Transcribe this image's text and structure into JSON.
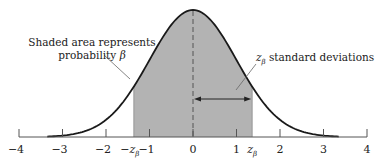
{
  "chart_data": {
    "type": "area",
    "title": "",
    "x_axis": {
      "ticks": [
        -4,
        -3,
        -2,
        -1,
        0,
        1,
        2,
        3,
        4
      ],
      "tick_labels": [
        "−4",
        "−3",
        "−2",
        "−1",
        "0",
        "1",
        "2",
        "3",
        "4"
      ],
      "range": [
        -4,
        4
      ],
      "special_labels": [
        {
          "x": -1.36,
          "text": "−z",
          "sub": "β"
        },
        {
          "x": 1.36,
          "text": "z",
          "sub": "β"
        }
      ]
    },
    "curve": {
      "function": "standard normal pdf",
      "x_range": [
        -3.35,
        3.35
      ]
    },
    "shaded_region": {
      "from": -1.36,
      "to": 1.36,
      "color": "#b3b3b3"
    },
    "center_line": {
      "x": 0,
      "style": "dashed"
    },
    "annotations": [
      {
        "id": "shaded",
        "text": "Shaded area represents",
        "text2": "probability ",
        "symbol": "β"
      },
      {
        "id": "zbeta",
        "sym": "z",
        "sub": "β",
        "text": " standard deviations"
      }
    ],
    "arrow": {
      "from": 0,
      "to": 1.36,
      "y_fraction": 0.4,
      "double_headed": true
    }
  },
  "colors": {
    "shade": "#b3b3b3",
    "curve": "#1a1a1a",
    "axis": "#555555",
    "leader": "#666666"
  }
}
